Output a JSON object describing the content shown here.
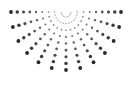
{
  "graphic": {
    "name": "half-sunburst-dot-pattern",
    "color": "#2a2a2a",
    "background": "#ffffff",
    "center": [
      66,
      12
    ],
    "rays": 13,
    "start_angle_deg": 0,
    "end_angle_deg": 180,
    "dots_per_ray": 9,
    "inner_radius": 5,
    "outer_radius_x": 55,
    "outer_radius_y": 58,
    "min_dot_radius": 0.5,
    "max_dot_radius": 1.9
  }
}
